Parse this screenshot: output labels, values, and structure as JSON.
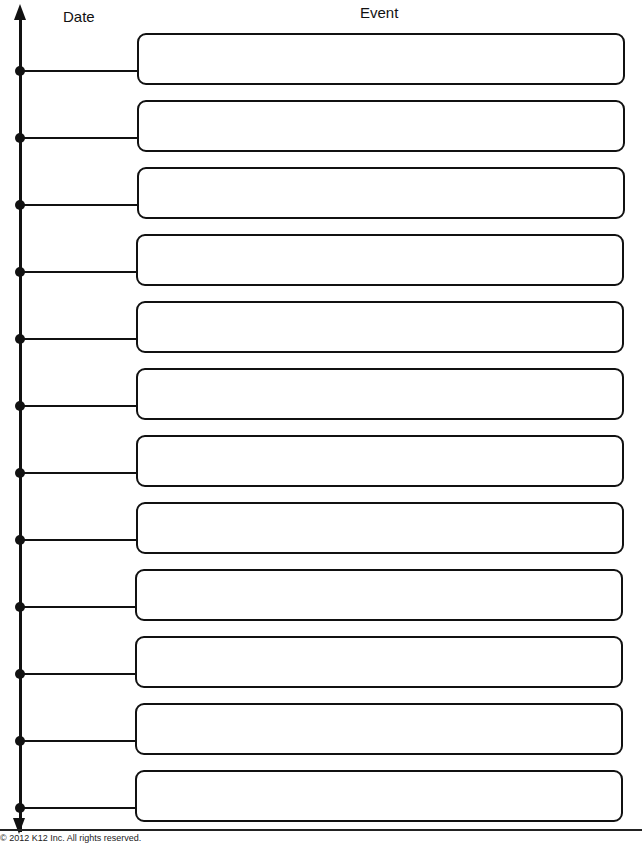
{
  "header": {
    "date_label": "Date",
    "event_label": "Event"
  },
  "timeline": {
    "axis_icon_top": "arrow-up-icon",
    "axis_icon_bottom": "arrow-down-icon",
    "rows": [
      {
        "date": "",
        "event": ""
      },
      {
        "date": "",
        "event": ""
      },
      {
        "date": "",
        "event": ""
      },
      {
        "date": "",
        "event": ""
      },
      {
        "date": "",
        "event": ""
      },
      {
        "date": "",
        "event": ""
      },
      {
        "date": "",
        "event": ""
      },
      {
        "date": "",
        "event": ""
      },
      {
        "date": "",
        "event": ""
      },
      {
        "date": "",
        "event": ""
      },
      {
        "date": "",
        "event": ""
      },
      {
        "date": "",
        "event": ""
      }
    ]
  },
  "footer": {
    "copyright": "© 2012 K12 Inc. All rights reserved."
  }
}
